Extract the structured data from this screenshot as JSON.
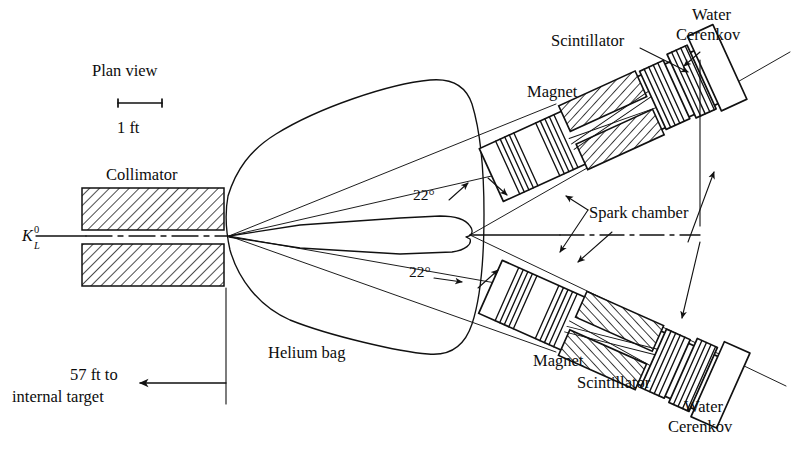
{
  "figure": {
    "domain": "Diagram",
    "title": "Plan view",
    "kind": "schematic-apparatus-plan-view",
    "background_color": "#ffffff",
    "ink_color": "#111111"
  },
  "scale_bar": {
    "label": "1 ft",
    "tick_style": "end-serifs"
  },
  "beam": {
    "particle_label": "K",
    "particle_superscript": "0",
    "particle_subscript": "L",
    "axis_style": "dash-dot"
  },
  "labels": {
    "plan_view": "Plan view",
    "collimator": "Collimator",
    "helium_bag": "Helium bag",
    "spark_chamber": "Spark chamber",
    "magnet_upper": "Magnet",
    "magnet_lower": "Magnet",
    "scintillator_upper": "Scintillator",
    "scintillator_lower": "Scintillator",
    "water_cerenkov_upper_line1": "Water",
    "water_cerenkov_upper_line2": "Cerenkov",
    "water_cerenkov_lower_line1": "Water",
    "water_cerenkov_lower_line2": "Cerenkov",
    "angle_upper": "22°",
    "angle_lower": "22°",
    "distance_line1": "57 ft to",
    "distance_line2": "internal target"
  },
  "geometry": {
    "arm_angle_deg": 22,
    "target_distance_ft": 57,
    "arms": [
      "upper",
      "lower"
    ],
    "components_per_arm": [
      "spark chamber",
      "magnet",
      "spark chamber",
      "scintillator",
      "water Cerenkov"
    ]
  },
  "annotations": {
    "spark_chamber_arrow": "double-headed leader to both arms",
    "scintillator_arrow_upper": "leader pointing down-right",
    "water_cerenkov_arrow_upper": "leader pointing down-left",
    "distance_arrow": "left arrow from collimator extension line"
  }
}
